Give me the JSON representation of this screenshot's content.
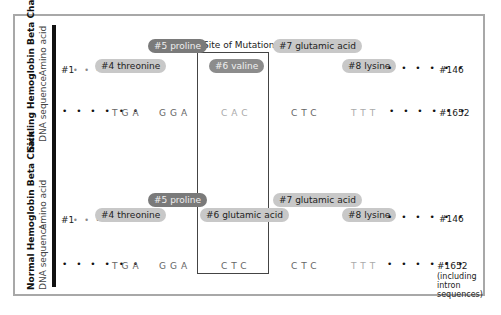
{
  "mutation_label": "Site of Mutation",
  "sickling": {
    "title": "Sickling Hemoglobin Beta Chain",
    "amino_label": "Amino acid",
    "dna_label": "DNA sequence",
    "start": "#1",
    "end_amino": "#146",
    "end_dna": "#1652",
    "amino_acids": [
      {
        "label": "#4 threonine",
        "style": "light"
      },
      {
        "label": "#5 proline",
        "style": "dark"
      },
      {
        "label": "#6 valine",
        "style": "dark-mid"
      },
      {
        "label": "#7 glutamic acid",
        "style": "light"
      },
      {
        "label": "#8 lysine",
        "style": "light"
      }
    ],
    "codons": [
      "TGA",
      "GGA",
      "CAC",
      "CTC",
      "TTT"
    ]
  },
  "normal": {
    "title": "Normal Hemoglobin Beta Chain",
    "amino_label": "Amino acid",
    "dna_label": "DNA sequence",
    "start": "#1",
    "end_amino": "#146",
    "end_dna": "#1652",
    "end_dna_note": "(including intron sequences)",
    "amino_acids": [
      {
        "label": "#4 threonine",
        "style": "light"
      },
      {
        "label": "#5 proline",
        "style": "dark"
      },
      {
        "label": "#6 glutamic acid",
        "style": "light"
      },
      {
        "label": "#7 glutamic acid",
        "style": "light"
      },
      {
        "label": "#8 lysine",
        "style": "light"
      }
    ],
    "codons": [
      "TGA",
      "GGA",
      "CTC",
      "CTC",
      "TTT"
    ]
  },
  "dots": {
    "short": "• • •",
    "long": "• • • • • •"
  },
  "colors": {
    "pill_light": "#c8c8c8",
    "pill_dark": "#7a7a7a",
    "frame": "#a8a8a8",
    "bar": "#111111"
  }
}
